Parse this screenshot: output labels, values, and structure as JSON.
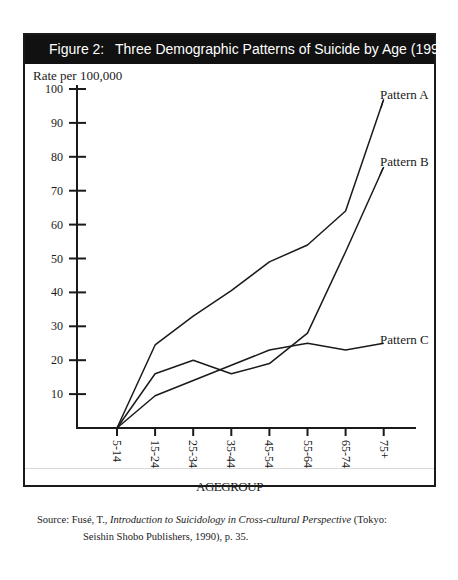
{
  "figure": {
    "number_label": "Figure 2:",
    "title": "Three Demographic Patterns of Suicide by Age (1990)"
  },
  "axes": {
    "ylabel": "Rate per 100,000",
    "xlabel": "AGEGROUP",
    "yticks": [
      "10",
      "20",
      "30",
      "40",
      "50",
      "60",
      "70",
      "80",
      "90",
      "100"
    ],
    "xticks": [
      "5-14",
      "15-24",
      "25-34",
      "35-44",
      "45-54",
      "55-64",
      "65-74",
      "75+"
    ]
  },
  "legend": {
    "pattern_a": "Pattern A",
    "pattern_b": "Pattern B",
    "pattern_c": "Pattern C"
  },
  "source": {
    "prefix": "Source:",
    "author": "Fusé, T.,",
    "book_title": "Introduction to Suicidology in Cross-cultural Perspective",
    "publisher_line1": "(Tokyo:",
    "publisher_line2": "Seishin Shobo Publishers, 1990), p. 35."
  },
  "chart_data": {
    "type": "line",
    "title": "Figure 2: Three Demographic Patterns of Suicide by Age (1990)",
    "xlabel": "AGE GROUP",
    "ylabel": "Rate per 100,000",
    "categories": [
      "5-14",
      "15-24",
      "25-34",
      "35-44",
      "45-54",
      "55-64",
      "65-74",
      "75+"
    ],
    "series": [
      {
        "name": "Pattern A",
        "values": [
          0,
          24.5,
          33,
          40.5,
          49,
          54,
          64,
          97
        ]
      },
      {
        "name": "Pattern B",
        "values": [
          0,
          16,
          20,
          16,
          19,
          28,
          52,
          77
        ]
      },
      {
        "name": "Pattern C",
        "values": [
          0,
          9.5,
          14,
          18.5,
          23,
          25,
          23,
          25
        ]
      }
    ],
    "ylim": [
      0,
      100
    ],
    "yticks": [
      10,
      20,
      30,
      40,
      50,
      60,
      70,
      80,
      90,
      100
    ],
    "grid": false,
    "legend_position": "inline labels at right end of each line",
    "source": "Fusé, T., Introduction to Suicidology in Cross-cultural Perspective (Tokyo: Seishin Shobo Publishers, 1990), p. 35."
  }
}
